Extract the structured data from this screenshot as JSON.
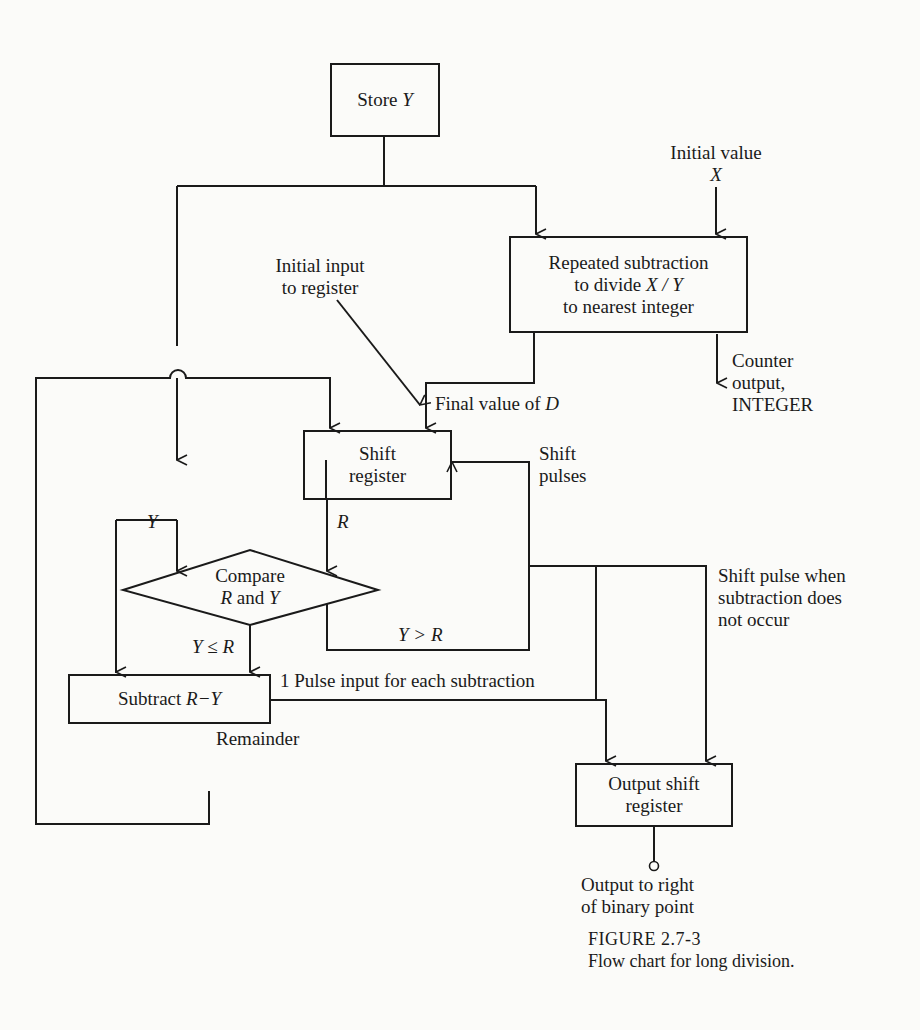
{
  "figure": {
    "number": "FIGURE 2.7-3",
    "title": "Flow chart for long division."
  },
  "nodes": {
    "store_y": {
      "text": "Store ",
      "var": "Y"
    },
    "repeated_subtraction": {
      "line1": "Repeated subtraction",
      "line2_prefix": "to divide ",
      "line2_var": "X / Y",
      "line3": "to nearest integer"
    },
    "shift_register": {
      "line1": "Shift",
      "line2": "register"
    },
    "compare": {
      "line1": "Compare",
      "line2_a": "R",
      "line2_b": " and ",
      "line2_c": "Y"
    },
    "subtract": {
      "text": "Subtract ",
      "var": "R−Y"
    },
    "output_shift_register": {
      "line1": "Output shift",
      "line2": "register"
    }
  },
  "labels": {
    "initial_value": "Initial value",
    "initial_value_var": "X",
    "initial_input": [
      "Initial input",
      "to register"
    ],
    "counter_output": [
      "Counter",
      "output,",
      "INTEGER"
    ],
    "final_value": "Final value of ",
    "final_value_var": "D",
    "shift_pulses": [
      "Shift",
      "pulses"
    ],
    "y_branch": "Y",
    "r_branch": "R",
    "y_le_r": "Y ≤ R",
    "y_gt_r": "Y > R",
    "pulse_input": "1 Pulse input for each subtraction",
    "remainder": "Remainder",
    "shift_pulse_when": [
      "Shift pulse when",
      "subtraction does",
      "not occur"
    ],
    "output_right": [
      "Output to right",
      "of binary point"
    ]
  }
}
